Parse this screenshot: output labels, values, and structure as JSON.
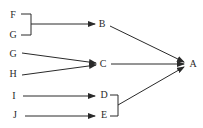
{
  "colors": {
    "background": "#ffffff",
    "stroke": "#2a2a2a",
    "text": "#2a2a2a"
  },
  "nodes": {
    "F": {
      "label": "F",
      "x": 13,
      "y": 15
    },
    "G1": {
      "label": "G",
      "x": 13,
      "y": 35
    },
    "G2": {
      "label": "G",
      "x": 13,
      "y": 54
    },
    "H": {
      "label": "H",
      "x": 13,
      "y": 74
    },
    "I": {
      "label": "I",
      "x": 14,
      "y": 96
    },
    "J": {
      "label": "J",
      "x": 15,
      "y": 115
    },
    "B": {
      "label": "B",
      "x": 102,
      "y": 24
    },
    "C": {
      "label": "C",
      "x": 103,
      "y": 64
    },
    "D": {
      "label": "D",
      "x": 103,
      "y": 95
    },
    "E": {
      "label": "E",
      "x": 103,
      "y": 115
    },
    "A": {
      "label": "A",
      "x": 192,
      "y": 64
    }
  },
  "edges": [
    {
      "from": "F+G",
      "to": "B",
      "type": "bracket-arrow"
    },
    {
      "from": "G",
      "to": "C",
      "type": "arrow"
    },
    {
      "from": "H",
      "to": "C",
      "type": "arrow"
    },
    {
      "from": "I",
      "to": "D",
      "type": "arrow"
    },
    {
      "from": "J",
      "to": "E",
      "type": "arrow"
    },
    {
      "from": "B",
      "to": "A",
      "type": "arrow"
    },
    {
      "from": "C",
      "to": "A",
      "type": "arrow"
    },
    {
      "from": "D+E",
      "to": "A",
      "type": "bracket-arrow"
    }
  ]
}
